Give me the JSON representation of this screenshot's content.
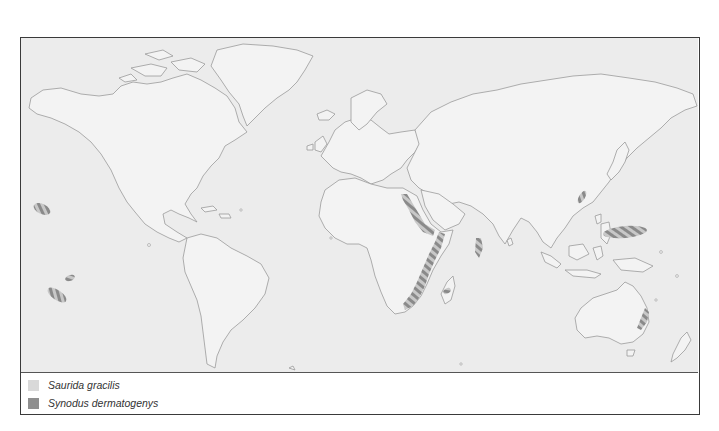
{
  "map": {
    "type": "species distribution world map",
    "ocean_color": "#ececec",
    "land_color": "#f2f2f2",
    "coastline_color": "#9a9a9a",
    "hatch_color": "#8a8a8a",
    "frame_color": "#3a3a3a",
    "distribution_areas": [
      {
        "species": "Synodus dermatogenys",
        "region": "Hawaii (central Pacific)"
      },
      {
        "species": "Synodus dermatogenys",
        "region": "Marquesas (south Pacific)"
      },
      {
        "species": "Synodus dermatogenys",
        "region": "Tuamotu / Society Islands (south Pacific)"
      },
      {
        "species": "Synodus dermatogenys",
        "region": "Red Sea"
      },
      {
        "species": "Synodus dermatogenys",
        "region": "East African coast"
      },
      {
        "species": "Synodus dermatogenys",
        "region": "Maldives / Chagos"
      },
      {
        "species": "Synodus dermatogenys",
        "region": "Mascarene Islands"
      },
      {
        "species": "Synodus dermatogenys",
        "region": "Ryukyu Islands / Taiwan"
      },
      {
        "species": "Synodus dermatogenys",
        "region": "Marshall / Caroline Islands (west Pacific)"
      },
      {
        "species": "Synodus dermatogenys",
        "region": "Eastern Australia"
      }
    ]
  },
  "legend": {
    "items": [
      {
        "label": "Saurida gracilis",
        "color": "#d9d9d9"
      },
      {
        "label": "Synodus dermatogenys",
        "color": "#8f8f8f"
      }
    ]
  }
}
